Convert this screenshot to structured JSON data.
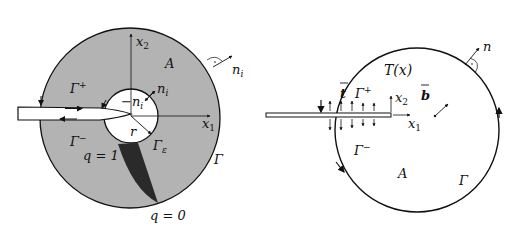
{
  "left_figure": {
    "labels": {
      "x2": "x",
      "x2_sub": "2",
      "x1": "x",
      "x1_sub": "1",
      "A": "A",
      "n_outer": "n",
      "n_outer_sub": "i",
      "n_inner": "n",
      "n_inner_sub": "i",
      "neg_n_inner": "−n",
      "neg_n_inner_sub": "i",
      "gamma_plus": "Γ",
      "gamma_plus_sup": "+",
      "gamma_minus": "Γ",
      "gamma_minus_sup": "−",
      "gamma_eps": "Γ",
      "gamma_eps_sub": "ε",
      "gamma": "Γ",
      "r": "r",
      "q1": "q = 1",
      "q0": "q = 0"
    },
    "colors": {
      "fill": "#b3b3b3",
      "dark_region": "#2a2a2a",
      "stroke": "#111111"
    }
  },
  "right_figure": {
    "labels": {
      "T": "T(x)",
      "t_bar": "t",
      "gamma_plus": "Γ",
      "gamma_plus_sup": "+",
      "gamma_minus": "Γ",
      "gamma_minus_sup": "−",
      "x2": "x",
      "x2_sub": "2",
      "x1": "x",
      "x1_sub": "1",
      "b_bar": "b",
      "n": "n",
      "A": "A",
      "gamma": "Γ"
    }
  }
}
